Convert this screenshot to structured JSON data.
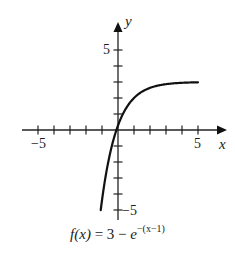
{
  "chart_data": {
    "type": "line",
    "function": "f(x) = 3 - e^(-(x-1))",
    "xlabel": "x",
    "ylabel": "y",
    "xlim": [
      -5.8,
      6.5
    ],
    "ylim": [
      -5.8,
      6.7
    ],
    "x_ticks": [
      -5,
      -4,
      -3,
      -2,
      -1,
      1,
      2,
      3,
      4,
      5
    ],
    "y_ticks": [
      -5,
      -4,
      -3,
      -2,
      -1,
      1,
      2,
      3,
      4,
      5
    ],
    "x_tick_labels": {
      "-5": "−5",
      "5": "5"
    },
    "y_tick_labels": {
      "-5": "−5",
      "5": "5"
    },
    "grid": false,
    "legend": null,
    "series": [
      {
        "name": "f(x)",
        "x": [
          -1.08,
          -1.0,
          -0.75,
          -0.5,
          -0.25,
          0,
          0.25,
          0.5,
          1,
          1.5,
          2,
          2.5,
          3,
          3.5,
          4,
          4.5,
          5
        ],
        "y": [
          -5.0,
          -4.39,
          -2.75,
          -1.48,
          -0.49,
          0.28,
          0.88,
          1.35,
          2.0,
          2.39,
          2.63,
          2.78,
          2.86,
          2.92,
          2.95,
          2.97,
          2.98
        ]
      }
    ],
    "asymptote": {
      "y": 3
    }
  },
  "labels": {
    "x_axis": "x",
    "y_axis": "y",
    "x_pos_5": "5",
    "x_neg_5": "−5",
    "y_pos_5": "5",
    "y_neg_5": "−5",
    "caption_fx": "f(x)",
    "caption_eq": " = 3 − ",
    "caption_e": "e",
    "caption_exp": "−(x−1)"
  }
}
